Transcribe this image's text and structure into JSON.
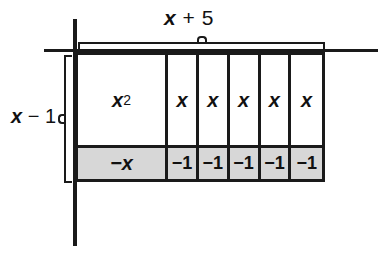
{
  "figure": {
    "background_color": "#ffffff",
    "line_color": "#1a1a1a",
    "shaded_fill": "#d7d7d7",
    "unshaded_fill": "#ffffff"
  },
  "axes": {
    "vertical_axis_name": "vertical-axis",
    "horizontal_axis_name": "horizontal-axis"
  },
  "top_dimension": {
    "label_var": "x",
    "label_op": " + ",
    "label_const": "5",
    "brace_name": "top-brace"
  },
  "left_dimension": {
    "label_var": "x",
    "label_op": " − ",
    "label_const": "1",
    "brace_name": "left-brace"
  },
  "grid": {
    "columns": [
      {
        "width_kind": "wide",
        "top_cell": {
          "var": "x",
          "sup": "2",
          "fill": "unshaded"
        },
        "bottom_cell": {
          "text": "−x",
          "fill": "shaded"
        }
      },
      {
        "width_kind": "unit",
        "top_cell": {
          "var": "x",
          "sup": "",
          "fill": "unshaded"
        },
        "bottom_cell": {
          "text": "−1",
          "fill": "shaded"
        }
      },
      {
        "width_kind": "unit",
        "top_cell": {
          "var": "x",
          "sup": "",
          "fill": "unshaded"
        },
        "bottom_cell": {
          "text": "−1",
          "fill": "shaded"
        }
      },
      {
        "width_kind": "unit",
        "top_cell": {
          "var": "x",
          "sup": "",
          "fill": "unshaded"
        },
        "bottom_cell": {
          "text": "−1",
          "fill": "shaded"
        }
      },
      {
        "width_kind": "unit",
        "top_cell": {
          "var": "x",
          "sup": "",
          "fill": "unshaded"
        },
        "bottom_cell": {
          "text": "−1",
          "fill": "shaded"
        }
      },
      {
        "width_kind": "unit",
        "top_cell": {
          "var": "x",
          "sup": "",
          "fill": "unshaded"
        },
        "bottom_cell": {
          "text": "−1",
          "fill": "shaded"
        }
      }
    ]
  }
}
